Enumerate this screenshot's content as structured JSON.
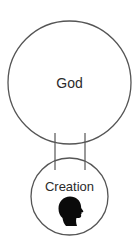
{
  "diagram": {
    "type": "relationship",
    "nodes": [
      {
        "id": "god",
        "label": "God",
        "shape": "circle",
        "cx": 69.5,
        "cy": 82.5,
        "r": 61.5
      },
      {
        "id": "creation",
        "label": "Creation",
        "shape": "circle",
        "cx": 69.5,
        "cy": 196.5,
        "r": 38.5,
        "icon": "human-head-silhouette-icon"
      }
    ],
    "connectors": [
      {
        "from": "god",
        "to": "creation",
        "x": 55,
        "y1": 133,
        "y2": 170
      },
      {
        "from": "god",
        "to": "creation",
        "x": 85,
        "y1": 133,
        "y2": 170
      }
    ],
    "colors": {
      "stroke": "#555555",
      "text": "#2b2b2b",
      "icon": "#0a0a0a",
      "background": "#ffffff"
    }
  }
}
